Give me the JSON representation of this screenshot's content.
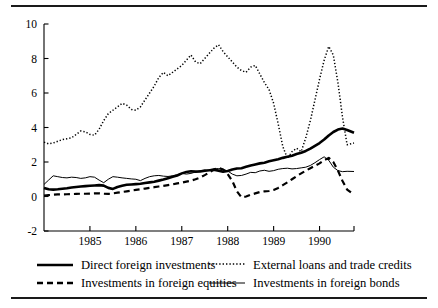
{
  "figure": {
    "top_rule": "horizontal-rule",
    "bottom_rule": "horizontal-rule"
  },
  "chart_data": {
    "type": "line",
    "title": "",
    "subtitle": "",
    "xlabel": "",
    "ylabel": "",
    "xlim": [
      1984.0,
      1990.75
    ],
    "ylim": [
      -2,
      10
    ],
    "yticks": [
      -2,
      0,
      2,
      4,
      6,
      8,
      10
    ],
    "ytick_labels": [
      "-2",
      "0",
      "2",
      "4",
      "6",
      "8",
      "10"
    ],
    "xticks": [
      1985,
      1986,
      1987,
      1988,
      1989,
      1990
    ],
    "xtick_labels": [
      "1985",
      "1986",
      "1987",
      "1988",
      "1989",
      "1990"
    ],
    "grid": false,
    "legend_position": "below-axes",
    "axis_spines": [
      "left",
      "bottom"
    ],
    "series": [
      {
        "name": "Direct foreign investments",
        "style": "solid-thick",
        "color": "#000000",
        "width": 2.6,
        "x": [
          1984.0,
          1984.1,
          1984.2,
          1984.3,
          1984.4,
          1984.5,
          1984.6,
          1984.7,
          1984.8,
          1984.9,
          1985.0,
          1985.1,
          1985.2,
          1985.3,
          1985.4,
          1985.5,
          1985.6,
          1985.7,
          1985.8,
          1985.9,
          1986.0,
          1986.1,
          1986.2,
          1986.3,
          1986.4,
          1986.5,
          1986.6,
          1986.7,
          1986.8,
          1986.9,
          1987.0,
          1987.1,
          1987.2,
          1987.3,
          1987.4,
          1987.5,
          1987.6,
          1987.7,
          1987.8,
          1987.9,
          1988.0,
          1988.1,
          1988.2,
          1988.3,
          1988.4,
          1988.5,
          1988.6,
          1988.7,
          1988.8,
          1988.9,
          1989.0,
          1989.1,
          1989.2,
          1989.3,
          1989.4,
          1989.5,
          1989.6,
          1989.7,
          1989.8,
          1989.9,
          1990.0,
          1990.1,
          1990.2,
          1990.3,
          1990.4,
          1990.5,
          1990.6,
          1990.75
        ],
        "y": [
          0.5,
          0.42,
          0.4,
          0.42,
          0.45,
          0.48,
          0.52,
          0.55,
          0.58,
          0.6,
          0.62,
          0.64,
          0.66,
          0.63,
          0.5,
          0.44,
          0.55,
          0.62,
          0.68,
          0.7,
          0.72,
          0.74,
          0.78,
          0.82,
          0.86,
          0.92,
          0.98,
          1.06,
          1.14,
          1.22,
          1.34,
          1.42,
          1.46,
          1.44,
          1.45,
          1.5,
          1.52,
          1.55,
          1.5,
          1.44,
          1.48,
          1.56,
          1.62,
          1.64,
          1.72,
          1.8,
          1.86,
          1.92,
          1.96,
          2.04,
          2.1,
          2.16,
          2.24,
          2.3,
          2.36,
          2.46,
          2.54,
          2.64,
          2.78,
          2.94,
          3.1,
          3.3,
          3.54,
          3.74,
          3.88,
          3.94,
          3.86,
          3.7
        ],
        "values_note": "rises from about 0.5 in 1984 to a peak near 4.3 in 1990, then eases to about 3.1"
      },
      {
        "name": "Investments in foreign equities",
        "style": "dashed",
        "color": "#000000",
        "width": 2.2,
        "x": [
          1984.0,
          1984.1,
          1984.2,
          1984.3,
          1984.4,
          1984.5,
          1984.6,
          1984.7,
          1984.8,
          1984.9,
          1985.0,
          1985.1,
          1985.2,
          1985.3,
          1985.4,
          1985.5,
          1985.6,
          1985.7,
          1985.8,
          1985.9,
          1986.0,
          1986.1,
          1986.2,
          1986.3,
          1986.4,
          1986.5,
          1986.6,
          1986.7,
          1986.8,
          1986.9,
          1987.0,
          1987.1,
          1987.2,
          1987.3,
          1987.4,
          1987.5,
          1987.6,
          1987.7,
          1987.8,
          1987.9,
          1988.0,
          1988.1,
          1988.2,
          1988.3,
          1988.4,
          1988.5,
          1988.6,
          1988.7,
          1988.8,
          1988.9,
          1989.0,
          1989.1,
          1989.2,
          1989.3,
          1989.4,
          1989.5,
          1989.6,
          1989.7,
          1989.8,
          1989.9,
          1990.0,
          1990.1,
          1990.2,
          1990.3,
          1990.4,
          1990.5,
          1990.6,
          1990.75
        ],
        "y": [
          0.05,
          0.08,
          0.1,
          0.12,
          0.12,
          0.13,
          0.14,
          0.15,
          0.16,
          0.16,
          0.17,
          0.18,
          0.18,
          0.16,
          0.15,
          0.18,
          0.22,
          0.26,
          0.3,
          0.34,
          0.38,
          0.42,
          0.46,
          0.5,
          0.54,
          0.58,
          0.62,
          0.66,
          0.7,
          0.76,
          0.8,
          0.86,
          0.92,
          1.0,
          1.1,
          1.24,
          1.4,
          1.56,
          1.66,
          1.56,
          1.3,
          0.9,
          0.3,
          -0.05,
          0.0,
          0.1,
          0.18,
          0.26,
          0.3,
          0.32,
          0.38,
          0.5,
          0.66,
          0.82,
          1.0,
          1.18,
          1.34,
          1.5,
          1.64,
          1.78,
          1.92,
          2.1,
          2.24,
          2.0,
          1.5,
          0.9,
          0.4,
          0.1
        ],
        "values_note": "near 0 through 1984-86, rises to about 1.7 in 1987, collapses to about -0.1 in 1988, recovers to about 2.3 in 1990, then falls back to near 0"
      },
      {
        "name": "External loans and trade credits",
        "style": "dotted",
        "color": "#000000",
        "width": 1.5,
        "x": [
          1984.0,
          1984.1,
          1984.2,
          1984.3,
          1984.4,
          1984.5,
          1984.6,
          1984.7,
          1984.8,
          1984.9,
          1985.0,
          1985.1,
          1985.2,
          1985.3,
          1985.4,
          1985.5,
          1985.6,
          1985.7,
          1985.8,
          1985.9,
          1986.0,
          1986.1,
          1986.2,
          1986.3,
          1986.4,
          1986.5,
          1986.6,
          1986.7,
          1986.8,
          1986.9,
          1987.0,
          1987.1,
          1987.2,
          1987.3,
          1987.4,
          1987.5,
          1987.6,
          1987.7,
          1987.8,
          1987.9,
          1988.0,
          1988.1,
          1988.2,
          1988.3,
          1988.4,
          1988.5,
          1988.6,
          1988.7,
          1988.8,
          1988.9,
          1989.0,
          1989.1,
          1989.2,
          1989.3,
          1989.4,
          1989.5,
          1989.6,
          1989.7,
          1989.8,
          1989.9,
          1990.0,
          1990.1,
          1990.2,
          1990.3,
          1990.4,
          1990.5,
          1990.6,
          1990.75
        ],
        "y": [
          3.15,
          3.05,
          3.1,
          3.2,
          3.3,
          3.35,
          3.4,
          3.6,
          3.8,
          3.75,
          3.6,
          3.55,
          3.9,
          4.4,
          4.8,
          5.0,
          5.2,
          5.4,
          5.3,
          5.05,
          5.0,
          5.2,
          5.6,
          6.0,
          6.4,
          6.9,
          7.2,
          7.0,
          7.2,
          7.4,
          7.6,
          7.9,
          8.2,
          7.8,
          7.7,
          8.0,
          8.3,
          8.6,
          8.8,
          8.4,
          8.1,
          7.8,
          7.5,
          7.3,
          7.2,
          7.5,
          7.6,
          7.1,
          6.6,
          6.2,
          5.4,
          4.2,
          2.9,
          2.2,
          2.6,
          2.8,
          2.6,
          3.4,
          4.4,
          5.6,
          6.8,
          7.9,
          8.7,
          8.2,
          6.6,
          4.6,
          3.0,
          3.1
        ],
        "values_note": "starts near 3.1, climbs irregularly to about 8.8 in 1987, drops sharply to about 2.2 in 1988, surges again to about 8.7 in 1990, then collapses to about 3.0"
      },
      {
        "name": "Investments in foreign bonds",
        "style": "solid-thin",
        "color": "#000000",
        "width": 1.0,
        "x": [
          1984.0,
          1984.1,
          1984.2,
          1984.3,
          1984.4,
          1984.5,
          1984.6,
          1984.7,
          1984.8,
          1984.9,
          1985.0,
          1985.1,
          1985.2,
          1985.3,
          1985.4,
          1985.5,
          1985.6,
          1985.7,
          1985.8,
          1985.9,
          1986.0,
          1986.1,
          1986.2,
          1986.3,
          1986.4,
          1986.5,
          1986.6,
          1986.7,
          1986.8,
          1986.9,
          1987.0,
          1987.1,
          1987.2,
          1987.3,
          1987.4,
          1987.5,
          1987.6,
          1987.7,
          1987.8,
          1987.9,
          1988.0,
          1988.1,
          1988.2,
          1988.3,
          1988.4,
          1988.5,
          1988.6,
          1988.7,
          1988.8,
          1988.9,
          1989.0,
          1989.1,
          1989.2,
          1989.3,
          1989.4,
          1989.5,
          1989.6,
          1989.7,
          1989.8,
          1989.9,
          1990.0,
          1990.1,
          1990.2,
          1990.3,
          1990.4,
          1990.5,
          1990.6,
          1990.75
        ],
        "y": [
          0.7,
          0.95,
          1.2,
          1.15,
          1.1,
          1.08,
          1.12,
          1.1,
          1.05,
          1.08,
          1.15,
          1.12,
          0.95,
          0.8,
          1.0,
          1.15,
          1.12,
          1.08,
          1.05,
          1.02,
          1.0,
          0.92,
          1.05,
          1.15,
          1.2,
          1.22,
          1.18,
          1.16,
          1.2,
          1.26,
          1.34,
          1.3,
          1.34,
          1.42,
          1.5,
          1.48,
          1.55,
          1.6,
          1.62,
          1.58,
          1.48,
          1.3,
          1.2,
          1.22,
          1.3,
          1.4,
          1.38,
          1.48,
          1.52,
          1.46,
          1.5,
          1.58,
          1.62,
          1.64,
          1.6,
          1.62,
          1.66,
          1.7,
          1.8,
          1.96,
          2.14,
          2.3,
          2.1,
          1.7,
          1.5,
          1.44,
          1.46,
          1.45
        ],
        "values_note": "fluctuates around 1 through 1984-86, drifts up to about 1.6 by 1987, dips near 1.2 in 1988, peaks about 2.3 in 1990, then settles near 1.45"
      }
    ]
  },
  "legend": {
    "entries": [
      {
        "label": "Direct foreign investments",
        "style": "solid-thick",
        "row": 1,
        "col": "left"
      },
      {
        "label": "External loans and trade credits",
        "style": "dotted",
        "row": 1,
        "col": "right"
      },
      {
        "label": "Investments in foreign equities",
        "style": "dashed",
        "row": 2,
        "col": "left"
      },
      {
        "label": "Investments in foreign bonds",
        "style": "solid-thin",
        "row": 2,
        "col": "right"
      }
    ]
  }
}
